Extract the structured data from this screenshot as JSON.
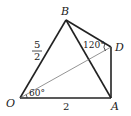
{
  "diagram": {
    "type": "geometry",
    "points": {
      "O": {
        "label": "O",
        "x": 20,
        "y": 98
      },
      "A": {
        "label": "A",
        "x": 111,
        "y": 98
      },
      "B": {
        "label": "B",
        "x": 66,
        "y": 20
      },
      "D": {
        "label": "D",
        "x": 111,
        "y": 47
      }
    },
    "segments": [
      "OB",
      "OA",
      "BA",
      "BD",
      "DA",
      "OD"
    ],
    "side_labels": {
      "OA": "2",
      "OB_numerator": "5",
      "OB_denominator": "2"
    },
    "angle_labels": {
      "BDO": "120°",
      "DOA": "60°"
    },
    "colors": {
      "stroke": "#222222",
      "thin_stroke": "#555555",
      "background": "#ffffff"
    }
  }
}
